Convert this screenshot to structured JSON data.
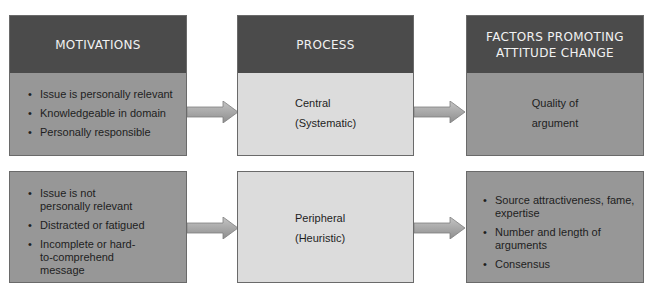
{
  "diagram": {
    "headers": {
      "motivations": "MOTIVATIONS",
      "process": "PROCESS",
      "factors": "FACTORS PROMOTING ATTITUDE CHANGE"
    },
    "rows": [
      {
        "name": "central-route",
        "motivations": [
          "Issue is personally relevant",
          "Knowledgeable in domain",
          "Personally responsible"
        ],
        "process": {
          "line1": "Central",
          "line2": "(Systematic)"
        },
        "factors": {
          "line1": "Quality of",
          "line2": "argument"
        }
      },
      {
        "name": "peripheral-route",
        "motivations": [
          "Issue is not personally relevant",
          "Distracted or fatigued",
          "Incomplete or hard-to-comprehend message"
        ],
        "process": {
          "line1": "Peripheral",
          "line2": "(Heuristic)"
        },
        "factors": [
          "Source  attractiveness, fame, expertise",
          "Number and length of arguments",
          "Consensus"
        ]
      }
    ],
    "colors": {
      "header": "#4b4b4b",
      "medium_body": "#979797",
      "light_body": "#dcdcdc",
      "arrow": "#a8a8a8"
    }
  }
}
